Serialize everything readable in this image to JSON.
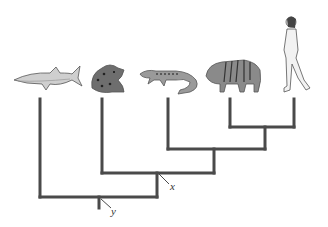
{
  "diagram": {
    "type": "cladogram",
    "organisms": [
      {
        "name": "shark",
        "icon": "shark-icon"
      },
      {
        "name": "frog",
        "icon": "frog-icon"
      },
      {
        "name": "lizard",
        "icon": "lizard-icon"
      },
      {
        "name": "tiger",
        "icon": "tiger-icon"
      },
      {
        "name": "human",
        "icon": "human-icon"
      }
    ],
    "labels": {
      "node_x": "x",
      "node_y": "y"
    },
    "colors": {
      "branch": "#4a4a4a",
      "background": "#ffffff"
    }
  }
}
